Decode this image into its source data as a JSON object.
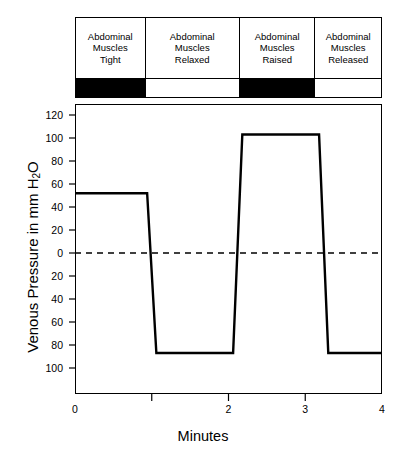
{
  "chart_data": {
    "type": "line",
    "title": "",
    "xlabel": "Minutes",
    "ylabel": "Venous Pressure in mm H2O",
    "ylabel_prefix": "Venous Pressure in mm H",
    "ylabel_sub": "2",
    "ylabel_suffix": "O",
    "xlim": [
      0,
      4
    ],
    "ylim": [
      -110,
      130
    ],
    "grid": false,
    "legend": "none",
    "zero_line": {
      "value": 0,
      "style": "dashed"
    },
    "yticks": [
      120,
      100,
      80,
      60,
      40,
      20,
      0,
      20,
      40,
      60,
      80,
      100
    ],
    "ytick_values": [
      120,
      100,
      80,
      60,
      40,
      20,
      0,
      -20,
      -40,
      -60,
      -80,
      -100
    ],
    "xticks": [
      0,
      2,
      3,
      4
    ],
    "xtick_values": [
      0,
      1,
      2,
      3,
      4
    ],
    "xtick_labels": [
      "0",
      "",
      "2",
      "3",
      "4"
    ],
    "series": [
      {
        "name": "Venous pressure",
        "color": "#000000",
        "x": [
          0.0,
          0.94,
          1.06,
          2.06,
          2.18,
          3.18,
          3.3,
          4.0
        ],
        "values": [
          52,
          52,
          -87,
          -87,
          103,
          103,
          -87,
          -87
        ]
      }
    ],
    "annotations": [
      {
        "label": "plateau-1",
        "value": 52,
        "units": "mm H2O"
      },
      {
        "label": "trough-1",
        "value": -87,
        "units": "mm H2O"
      },
      {
        "label": "plateau-2",
        "value": 103,
        "units": "mm H2O"
      },
      {
        "label": "trough-2",
        "value": -87,
        "units": "mm H2O"
      }
    ]
  },
  "conditions": {
    "cells": [
      {
        "line1": "Abdominal",
        "line2": "Muscles",
        "line3": "Tight",
        "bar": "filled",
        "width": 70
      },
      {
        "line1": "Abdominal",
        "line2": "Muscles",
        "line3": "Relaxed",
        "bar": "empty",
        "width": 95
      },
      {
        "line1": "Abdominal",
        "line2": "Muscles",
        "line3": "Raised",
        "bar": "filled",
        "width": 76
      },
      {
        "line1": "Abdominal",
        "line2": "Muscles",
        "line3": "Released",
        "bar": "empty",
        "width": 66
      }
    ]
  },
  "colors": {
    "line": "#000000",
    "frame": "#000000",
    "bar_filled": "#000000",
    "background": "#ffffff"
  }
}
